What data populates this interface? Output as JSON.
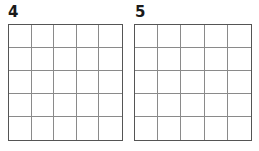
{
  "grids": [
    {
      "label": "4",
      "rows": 5,
      "cols": 5
    },
    {
      "label": "5",
      "rows": 5,
      "cols": 5
    }
  ],
  "colors": {
    "border": "#555555",
    "lines": "#8a8a8a",
    "label": "#1a1a1a"
  }
}
